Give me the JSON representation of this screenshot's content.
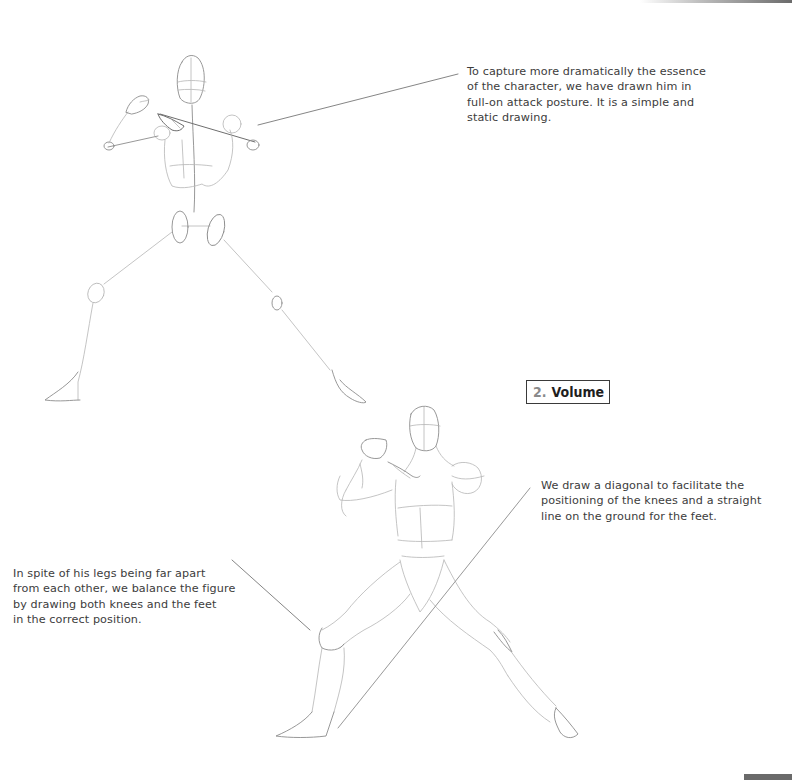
{
  "page": {
    "captions": {
      "skeleton": {
        "lines": [
          "To capture more dramatically the essence",
          "of the character, we have drawn him in",
          "full-on attack posture. It is a simple and",
          "static drawing."
        ]
      },
      "diagonal": {
        "lines": [
          "We draw a diagonal to facilitate the",
          "positioning of the knees and a straight",
          "line on the ground for the feet."
        ]
      },
      "balance": {
        "lines": [
          "In spite of his legs being far apart",
          "from each other, we balance the figure",
          "by drawing both knees and the feet",
          "in the correct position."
        ]
      }
    },
    "section": {
      "number": "2.",
      "title": "Volume"
    },
    "illustrations": [
      {
        "name": "skeleton-figure",
        "description": "Stick-figure sketch in attack posture"
      },
      {
        "name": "volume-figure",
        "description": "Volume sketch of fighter in attack posture with diagonal guide line"
      }
    ]
  }
}
